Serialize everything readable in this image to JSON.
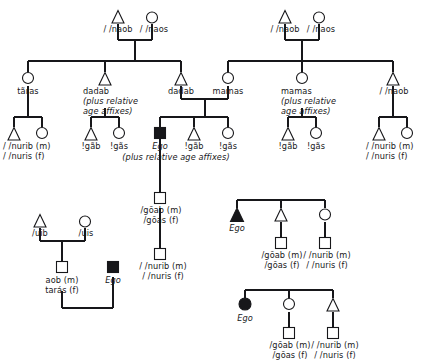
{
  "diagram": {
    "stroke_color": "#17171a",
    "fill_color": "#17171a",
    "background": "#ffffff",
    "symbol_legend": {
      "triangle_open": "male",
      "circle_open": "female",
      "square_open": "sex-unspecified",
      "triangle_filled": "ego-male",
      "circle_filled": "ego-female",
      "square_filled": "ego-unspecified"
    }
  },
  "labels": {
    "gp_left_father": "/ /naob",
    "gp_left_mother": "/ /naos",
    "gp_right_father": "/ /naob",
    "gp_right_mother": "/ /naos",
    "taras": "tãras",
    "dadab_1": "dadab",
    "dadab_1_note_l1": "(plus relative",
    "dadab_1_note_l2": "age affixes)",
    "dadab_2": "dadab",
    "mamas_1": "mamas",
    "mamas_2": "mamas",
    "mamas_2_note_l1": "(plus relative",
    "mamas_2_note_l2": "age affixes)",
    "naob_uncle": "/ /naob",
    "nurib_m_a": "/ /nurib (m)",
    "nuris_f_a": "/ /nuris (f)",
    "gab_a": "!gãb",
    "gas_a": "!gãs",
    "ego_center": "Ego",
    "ego_center_note": "(plus relative age affixes)",
    "gab_b": "!gãb",
    "gas_b": "!gãs",
    "gab_c": "!gãb",
    "gas_c": "!gãs",
    "nurib_m_b": "/ /nurib (m)",
    "nuris_f_b": "/ /nuris (f)",
    "goab_m_center": "/gõab (m)",
    "goas_f_center": "/gõas (f)",
    "nurib_m_center": "/ /nurib (m)",
    "nuris_f_center": "/ /nuris (f)",
    "uib": "/uib",
    "uis": "/uis",
    "aob_m": "aob (m)",
    "taras_f": "tarás (f)",
    "ego_bottom_left": "Ego",
    "ego_mid_right": "Ego",
    "goab_m_r1": "/gõab (m)",
    "goas_f_r1": "/gõas (f)",
    "nurib_m_r1": "/ /nurib (m)",
    "nuris_f_r1": "/ /nuris (f)",
    "ego_bottom_right": "Ego",
    "goab_m_r2": "/gõab (m)",
    "goas_f_r2": "/gõas (f)",
    "nurib_m_r2": "/ /nurib (m)",
    "nuris_f_r2": "/ /nuris (f)"
  }
}
